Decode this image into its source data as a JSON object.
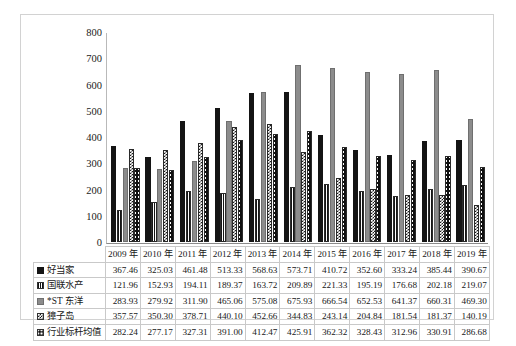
{
  "chart_data": {
    "type": "bar",
    "title": "",
    "xlabel": "",
    "ylabel": "",
    "ylim": [
      0,
      800
    ],
    "yticks": [
      800,
      700,
      600,
      500,
      400,
      300,
      200,
      100,
      0
    ],
    "grid": false,
    "legend_position": "table-left",
    "categories": [
      "2009 年",
      "2010 年",
      "2011 年",
      "2012 年",
      "2013 年",
      "2014 年",
      "2015 年",
      "2016 年",
      "2017 年",
      "2018 年",
      "2019 年"
    ],
    "series": [
      {
        "name": "好当家",
        "marker": "solid-black-square-icon",
        "values": [
          367.46,
          325.03,
          461.48,
          513.33,
          568.63,
          573.71,
          410.72,
          352.6,
          333.24,
          385.44,
          390.67
        ]
      },
      {
        "name": "国联水产",
        "marker": "vertical-stripe-square-icon",
        "values": [
          121.96,
          152.93,
          194.11,
          189.37,
          163.72,
          209.89,
          221.33,
          195.19,
          176.68,
          202.18,
          219.07
        ]
      },
      {
        "name": "*ST 东洋",
        "marker": "gray-square-icon",
        "values": [
          283.93,
          279.92,
          311.9,
          465.06,
          575.08,
          675.93,
          666.54,
          652.53,
          641.37,
          660.31,
          469.3
        ]
      },
      {
        "name": "獐子岛",
        "marker": "checkered-square-icon",
        "values": [
          357.57,
          350.3,
          378.71,
          440.1,
          452.66,
          344.83,
          243.14,
          204.84,
          181.54,
          181.37,
          140.19
        ]
      },
      {
        "name": "行业标杆均值",
        "marker": "diamond-dot-square-icon",
        "values": [
          282.24,
          277.17,
          327.31,
          391.0,
          412.47,
          425.91,
          362.32,
          328.43,
          312.96,
          330.91,
          286.68
        ]
      }
    ]
  }
}
